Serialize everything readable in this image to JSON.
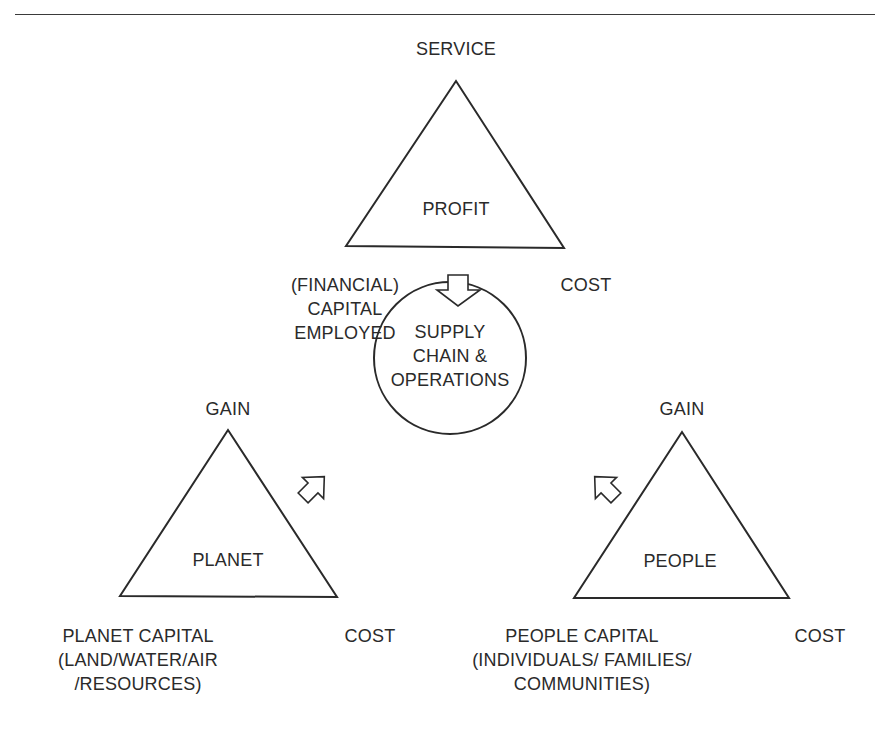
{
  "diagram": {
    "profit_triangle": {
      "inner_label": "PROFIT",
      "top_label": "SERVICE",
      "bottom_left_label": "(FINANCIAL)\nCAPITAL\nEMPLOYED",
      "bottom_right_label": "COST"
    },
    "center": {
      "label": "SUPPLY\nCHAIN &\nOPERATIONS"
    },
    "planet_triangle": {
      "inner_label": "PLANET",
      "top_label": "GAIN",
      "bottom_left_label": "PLANET CAPITAL\n(LAND/WATER/AIR\n/RESOURCES)",
      "bottom_right_label": "COST"
    },
    "people_triangle": {
      "inner_label": "PEOPLE",
      "top_label": "GAIN",
      "bottom_left_label": "PEOPLE CAPITAL\n(INDIVIDUALS/ FAMILIES/\nCOMMUNITIES)",
      "bottom_right_label": "COST"
    },
    "arrows": [
      {
        "name": "profit-to-center",
        "direction": "down"
      },
      {
        "name": "planet-to-center",
        "direction": "up-right"
      },
      {
        "name": "people-to-center",
        "direction": "up-left"
      }
    ],
    "colors": {
      "stroke": "#2a2a2a",
      "background": "#ffffff"
    }
  }
}
